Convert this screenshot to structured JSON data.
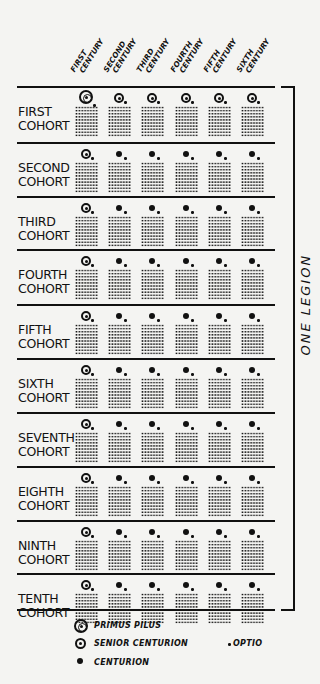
{
  "centuries": [
    "FIRST CENTURY",
    "SECOND CENTURY",
    "THIRD CENTURY",
    "FOURTH CENTURY",
    "FIFTH CENTURY",
    "SIXTH CENTURY"
  ],
  "century_lines": [
    [
      "FIRST",
      "CENTURY"
    ],
    [
      "SECOND",
      "CENTURY"
    ],
    [
      "THIRD",
      "CENTURY"
    ],
    [
      "FOURTH",
      "CENTURY"
    ],
    [
      "FIFTH",
      "CENTURY"
    ],
    [
      "SIXTH",
      "CENTURY"
    ]
  ],
  "cohorts": [
    {
      "line1": "FIRST",
      "line2": "COHORT",
      "commander": "primus-pilus",
      "centuries": [
        "primus-pilus",
        "senior-centurion",
        "senior-centurion",
        "senior-centurion",
        "senior-centurion",
        "senior-centurion"
      ]
    },
    {
      "line1": "SECOND",
      "line2": "COHORT",
      "commander": "senior-centurion",
      "centuries": [
        "senior-centurion",
        "centurion",
        "centurion",
        "centurion",
        "centurion",
        "centurion"
      ]
    },
    {
      "line1": "THIRD",
      "line2": "COHORT",
      "commander": "senior-centurion",
      "centuries": [
        "senior-centurion",
        "centurion",
        "centurion",
        "centurion",
        "centurion",
        "centurion"
      ]
    },
    {
      "line1": "FOURTH",
      "line2": "COHORT",
      "commander": "senior-centurion",
      "centuries": [
        "senior-centurion",
        "centurion",
        "centurion",
        "centurion",
        "centurion",
        "centurion"
      ]
    },
    {
      "line1": "FIFTH",
      "line2": "COHORT",
      "commander": "senior-centurion",
      "centuries": [
        "senior-centurion",
        "centurion",
        "centurion",
        "centurion",
        "centurion",
        "centurion"
      ]
    },
    {
      "line1": "SIXTH",
      "line2": "COHORT",
      "commander": "senior-centurion",
      "centuries": [
        "senior-centurion",
        "centurion",
        "centurion",
        "centurion",
        "centurion",
        "centurion"
      ]
    },
    {
      "line1": "SEVENTH",
      "line2": "COHORT",
      "commander": "senior-centurion",
      "centuries": [
        "senior-centurion",
        "centurion",
        "centurion",
        "centurion",
        "centurion",
        "centurion"
      ]
    },
    {
      "line1": "EIGHTH",
      "line2": "COHORT",
      "commander": "senior-centurion",
      "centuries": [
        "senior-centurion",
        "centurion",
        "centurion",
        "centurion",
        "centurion",
        "centurion"
      ]
    },
    {
      "line1": "NINTH",
      "line2": "COHORT",
      "commander": "senior-centurion",
      "centuries": [
        "senior-centurion",
        "centurion",
        "centurion",
        "centurion",
        "centurion",
        "centurion"
      ]
    },
    {
      "line1": "TENTH",
      "line2": "COHORT",
      "commander": "senior-centurion",
      "centuries": [
        "senior-centurion",
        "centurion",
        "centurion",
        "centurion",
        "centurion",
        "centurion"
      ]
    }
  ],
  "bracket_label": "ONE LEGION",
  "legend": {
    "primus_pilus": "PRIMUS PILUS",
    "senior_centurion": "SENIOR CENTURION",
    "centurion": "CENTURION",
    "optio": "OPTIO"
  }
}
